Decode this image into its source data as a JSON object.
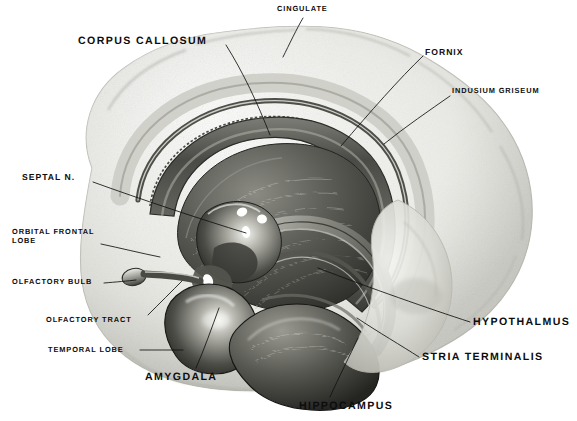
{
  "figure": {
    "kind": "anatomical-illustration",
    "background_color": "#ffffff",
    "ink_color": "#0d0d0d",
    "width": 577,
    "height": 421
  },
  "labels": [
    {
      "id": "cingulate",
      "text": "CINGULATE",
      "size": "small",
      "x": 277,
      "y": 5,
      "align": "left",
      "leader": [
        [
          303,
          18
        ],
        [
          297,
          28
        ],
        [
          289,
          45
        ],
        [
          283,
          57
        ]
      ]
    },
    {
      "id": "corpus-callosum",
      "text": "CORPUS CALLOSUM",
      "size": "large",
      "x": 78,
      "y": 35,
      "align": "left",
      "leader": [
        [
          226,
          45
        ],
        [
          243,
          72
        ],
        [
          258,
          104
        ],
        [
          270,
          135
        ]
      ]
    },
    {
      "id": "fornix",
      "text": "FORNIX",
      "size": "medium",
      "x": 425,
      "y": 47,
      "align": "left",
      "leader": [
        [
          423,
          56
        ],
        [
          400,
          78
        ],
        [
          370,
          112
        ],
        [
          341,
          146
        ]
      ]
    },
    {
      "id": "indusium-griseum",
      "text": "INDUSIUM GRISEUM",
      "size": "small",
      "x": 452,
      "y": 87,
      "align": "left",
      "leader": [
        [
          450,
          96
        ],
        [
          430,
          110
        ],
        [
          405,
          127
        ],
        [
          384,
          144
        ]
      ]
    },
    {
      "id": "septal-n",
      "text": "SEPTAL N.",
      "size": "medium",
      "x": 22,
      "y": 172,
      "align": "left",
      "leader": [
        [
          93,
          182
        ],
        [
          140,
          199
        ],
        [
          200,
          219
        ],
        [
          246,
          233
        ]
      ]
    },
    {
      "id": "orbital-frontal-lobe",
      "text": "ORBITAL FRONTAL\nLOBE",
      "size": "small",
      "x": 12,
      "y": 228,
      "align": "left",
      "leader": [
        [
          101,
          244
        ],
        [
          120,
          248
        ],
        [
          140,
          253
        ],
        [
          160,
          257
        ]
      ]
    },
    {
      "id": "olfactory-bulb",
      "text": "OLFACTORY BULB",
      "size": "small",
      "x": 12,
      "y": 278,
      "align": "left",
      "leader": [
        [
          104,
          283
        ],
        [
          116,
          282
        ],
        [
          128,
          281
        ],
        [
          136,
          280
        ]
      ]
    },
    {
      "id": "olfactory-tract",
      "text": "OLFACTORY TRACT",
      "size": "small",
      "x": 46,
      "y": 316,
      "align": "left",
      "leader": [
        [
          148,
          315
        ],
        [
          160,
          303
        ],
        [
          172,
          291
        ],
        [
          182,
          281
        ]
      ]
    },
    {
      "id": "temporal-lobe",
      "text": "TEMPORAL LOBE",
      "size": "small",
      "x": 48,
      "y": 346,
      "align": "left",
      "leader": [
        [
          140,
          350
        ],
        [
          155,
          350
        ],
        [
          170,
          350
        ],
        [
          183,
          350
        ]
      ]
    },
    {
      "id": "amygdala",
      "text": "AMYGDALA",
      "size": "large",
      "x": 145,
      "y": 371,
      "align": "left",
      "leader": [
        [
          196,
          368
        ],
        [
          204,
          350
        ],
        [
          212,
          327
        ],
        [
          219,
          308
        ]
      ]
    },
    {
      "id": "hippocampus",
      "text": "HIPPOCAMPUS",
      "size": "large",
      "x": 299,
      "y": 400,
      "align": "left",
      "leader": [
        [
          330,
          397
        ],
        [
          339,
          377
        ],
        [
          350,
          355
        ],
        [
          358,
          338
        ]
      ]
    },
    {
      "id": "stria-terminalis",
      "text": "STRIA TERMINALIS",
      "size": "large",
      "x": 422,
      "y": 351,
      "align": "left",
      "leader": [
        [
          419,
          357
        ],
        [
          402,
          346
        ],
        [
          378,
          332
        ],
        [
          357,
          318
        ]
      ]
    },
    {
      "id": "hypothalmus",
      "text": "HYPOTHALMUS",
      "size": "large",
      "x": 473,
      "y": 316,
      "align": "left",
      "leader": [
        [
          470,
          322
        ],
        [
          430,
          309
        ],
        [
          370,
          288
        ],
        [
          318,
          268
        ]
      ]
    }
  ]
}
